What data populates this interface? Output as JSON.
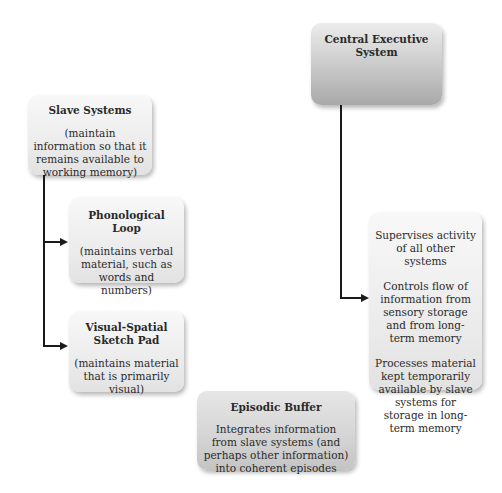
{
  "diagram": {
    "central_executive": {
      "title": "Central Executive System",
      "functions": [
        "Supervises activity of all other systems",
        "Controls flow of information from sensory storage and from long-term memory",
        "Processes material kept temporarily available by slave systems for storage in long-term memory"
      ]
    },
    "slave_systems": {
      "title": "Slave Systems",
      "description": "(maintain information so that it remains available to working memory)"
    },
    "phonological_loop": {
      "title": "Phonological Loop",
      "description": "(maintains verbal material, such as words and numbers)"
    },
    "visual_spatial": {
      "title": "Visual-Spatial Sketch Pad",
      "description": "(maintains material that is primarily visual)"
    },
    "episodic_buffer": {
      "title": "Episodic Buffer",
      "description": "Integrates information from slave systems (and perhaps other information) into coherent episodes"
    }
  }
}
